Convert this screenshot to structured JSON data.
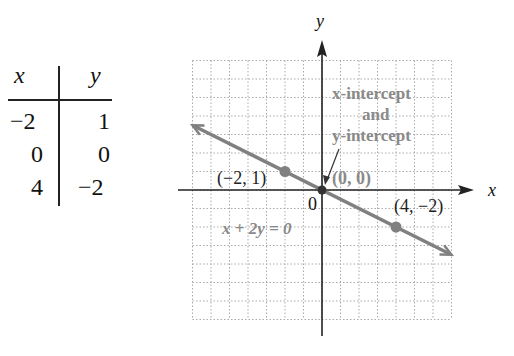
{
  "table": {
    "headers": [
      "x",
      "y"
    ],
    "rows": [
      [
        "−2",
        "1"
      ],
      [
        "0",
        "0"
      ],
      [
        "4",
        "−2"
      ]
    ]
  },
  "chart_data": {
    "type": "line",
    "title": "",
    "equation": "x + 2y = 0",
    "xlabel": "x",
    "ylabel": "y",
    "xlim": [
      -7,
      7
    ],
    "ylim": [
      -7,
      7
    ],
    "grid": true,
    "line": {
      "x": [
        -7,
        7
      ],
      "y": [
        3.5,
        -3.5
      ],
      "color": "#808080"
    },
    "points": [
      {
        "x": -2,
        "y": 1,
        "label": "(−2, 1)"
      },
      {
        "x": 0,
        "y": 0,
        "label": "(0, 0)"
      },
      {
        "x": 4,
        "y": -2,
        "label": "(4, −2)"
      }
    ],
    "origin_label": "0",
    "annotation": {
      "lines": [
        "x-intercept",
        "and",
        "y-intercept"
      ],
      "points_to": [
        0,
        0
      ]
    },
    "colors": {
      "line": "#808080",
      "point": "#808080",
      "grid": "#aaaaaa",
      "axis": "#222222",
      "annotation": "#8a8a8a"
    }
  }
}
